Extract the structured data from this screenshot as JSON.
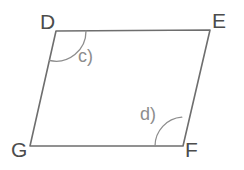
{
  "figure": {
    "kind": "geometry-diagram",
    "shape_name": "parallelogram",
    "background_color": "#ffffff",
    "stroke_color": "#6e6e6e",
    "arc_color": "#8d8d8d",
    "label_color": "#4c4c4c",
    "angle_label_color": "#8d8d8d",
    "stroke_width": 1.6,
    "arc_width": 1.3,
    "vertices": [
      {
        "id": "D",
        "label": "D",
        "x": 56,
        "y": 31,
        "label_x": 40,
        "label_y": 11
      },
      {
        "id": "E",
        "label": "E",
        "x": 210,
        "y": 30,
        "label_x": 212,
        "label_y": 10
      },
      {
        "id": "F",
        "label": "F",
        "x": 183,
        "y": 146,
        "label_x": 185,
        "label_y": 139
      },
      {
        "id": "G",
        "label": "G",
        "x": 30,
        "y": 146,
        "label_x": 11,
        "label_y": 139
      }
    ],
    "edges": [
      {
        "id": "DE",
        "from": "D",
        "to": "E"
      },
      {
        "id": "EF",
        "from": "E",
        "to": "F"
      },
      {
        "id": "FG",
        "from": "F",
        "to": "G"
      },
      {
        "id": "GD",
        "from": "G",
        "to": "D"
      }
    ],
    "polygon_points": "56,31 210,30 183,146 30,146",
    "angles": [
      {
        "id": "c",
        "label": "c)",
        "at_vertex": "D",
        "arc_path": "M 86 31 A 30 30 0 0 1 49.5 60.5",
        "label_x": 78,
        "label_y": 47
      },
      {
        "id": "d",
        "label": "d)",
        "at_vertex": "F",
        "arc_path": "M 155 146 A 29 29 0 0 1 181.8 117.2",
        "label_x": 140,
        "label_y": 105
      }
    ]
  }
}
